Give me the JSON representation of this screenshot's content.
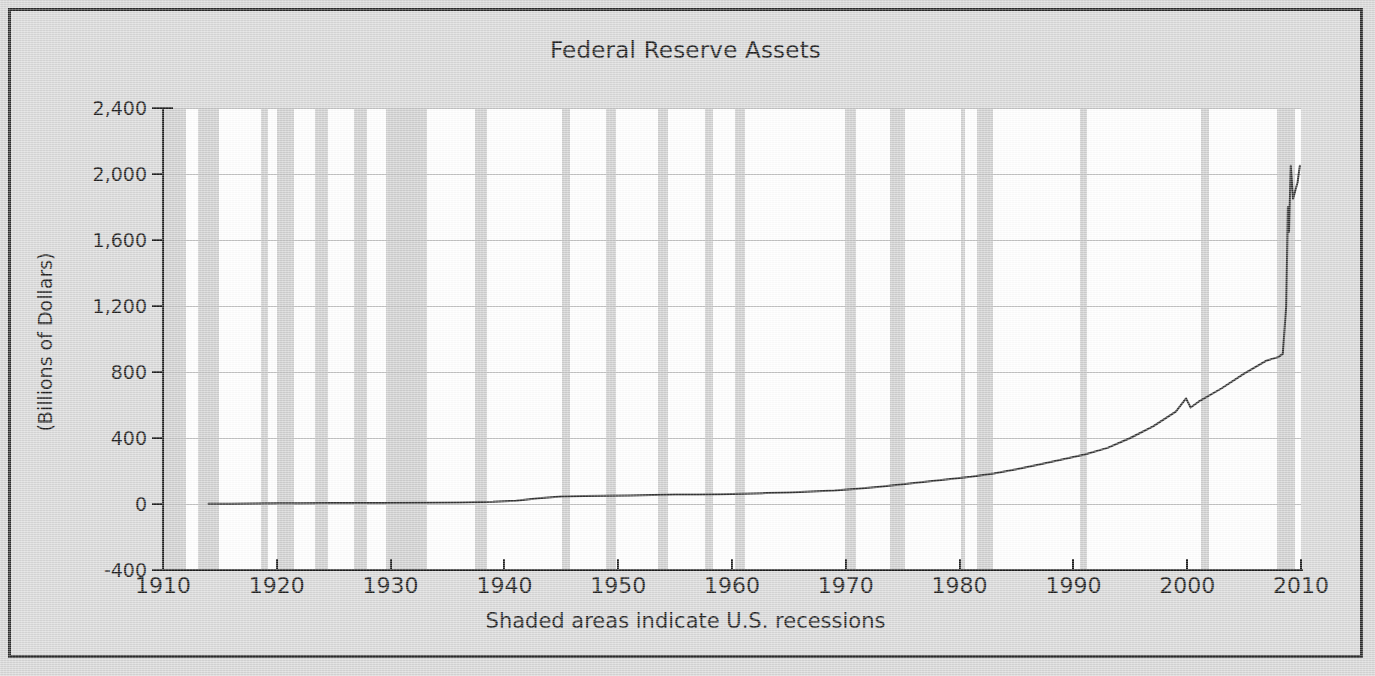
{
  "chart_data": {
    "type": "line",
    "title": "Federal Reserve Assets",
    "xlabel": "",
    "ylabel": "(Billions of Dollars)",
    "footer": "Shaded areas indicate U.S. recessions",
    "xlim": [
      1910,
      2010
    ],
    "ylim": [
      -400,
      2400
    ],
    "grid": true,
    "legend": "none",
    "x_ticks": [
      "1910",
      "1920",
      "1930",
      "1940",
      "1950",
      "1960",
      "1970",
      "1980",
      "1990",
      "2000",
      "2010"
    ],
    "x_tick_values": [
      1910,
      1920,
      1930,
      1940,
      1950,
      1960,
      1970,
      1980,
      1990,
      2000,
      2010
    ],
    "y_ticks": [
      "2,400",
      "2,000",
      "1,600",
      "1,200",
      "800",
      "400",
      "0",
      "-400"
    ],
    "y_tick_values": [
      2400,
      2000,
      1600,
      1200,
      800,
      400,
      0,
      -400
    ],
    "series": [
      {
        "name": "Federal Reserve Assets",
        "color": "#333333",
        "x": [
          1914.0,
          1916.0,
          1918.0,
          1920.0,
          1922.0,
          1925.0,
          1929.0,
          1933.0,
          1936.0,
          1939.0,
          1941.0,
          1943.0,
          1945.0,
          1947.0,
          1949.0,
          1951.0,
          1953.0,
          1955.0,
          1957.0,
          1959.0,
          1961.0,
          1963.0,
          1965.0,
          1967.0,
          1969.0,
          1971.0,
          1973.0,
          1975.0,
          1977.0,
          1979.0,
          1981.0,
          1983.0,
          1985.0,
          1987.0,
          1989.0,
          1991.0,
          1993.0,
          1995.0,
          1997.0,
          1999.0,
          1999.9,
          2000.3,
          2001.0,
          2003.0,
          2005.0,
          2007.0,
          2008.0,
          2008.4,
          2008.7,
          2008.85,
          2008.95,
          2009.1,
          2009.3,
          2009.5,
          2009.7,
          2009.9
        ],
        "y": [
          1,
          2,
          3,
          5,
          5,
          6,
          6,
          7,
          9,
          13,
          20,
          35,
          45,
          48,
          50,
          52,
          55,
          57,
          58,
          59,
          62,
          66,
          70,
          76,
          82,
          92,
          105,
          120,
          135,
          150,
          165,
          185,
          210,
          240,
          270,
          300,
          340,
          400,
          470,
          560,
          640,
          585,
          620,
          700,
          790,
          870,
          890,
          910,
          1200,
          1800,
          1650,
          2050,
          1850,
          1900,
          1950,
          2050
        ]
      }
    ],
    "recessions": [
      {
        "start": 1910.0,
        "end": 1912.0
      },
      {
        "start": 1913.1,
        "end": 1914.9
      },
      {
        "start": 1918.6,
        "end": 1919.2
      },
      {
        "start": 1920.0,
        "end": 1921.5
      },
      {
        "start": 1923.4,
        "end": 1924.5
      },
      {
        "start": 1926.8,
        "end": 1927.9
      },
      {
        "start": 1929.6,
        "end": 1933.2
      },
      {
        "start": 1937.4,
        "end": 1938.5
      },
      {
        "start": 1945.1,
        "end": 1945.8
      },
      {
        "start": 1948.9,
        "end": 1949.8
      },
      {
        "start": 1953.5,
        "end": 1954.4
      },
      {
        "start": 1957.6,
        "end": 1958.3
      },
      {
        "start": 1960.3,
        "end": 1961.1
      },
      {
        "start": 1969.9,
        "end": 1970.9
      },
      {
        "start": 1973.9,
        "end": 1975.2
      },
      {
        "start": 1980.1,
        "end": 1980.5
      },
      {
        "start": 1981.5,
        "end": 1982.9
      },
      {
        "start": 1990.6,
        "end": 1991.2
      },
      {
        "start": 2001.2,
        "end": 2001.9
      },
      {
        "start": 2007.9,
        "end": 2009.5
      }
    ],
    "colors": {
      "figure_background": "#d8d8d8",
      "plot_background": "#ffffff",
      "recession_band": "#cfcfcf",
      "gridline": "#c2c2c2",
      "axis": "#1c1c1c",
      "series_line": "#333333",
      "text": "#1c1c1c"
    }
  }
}
